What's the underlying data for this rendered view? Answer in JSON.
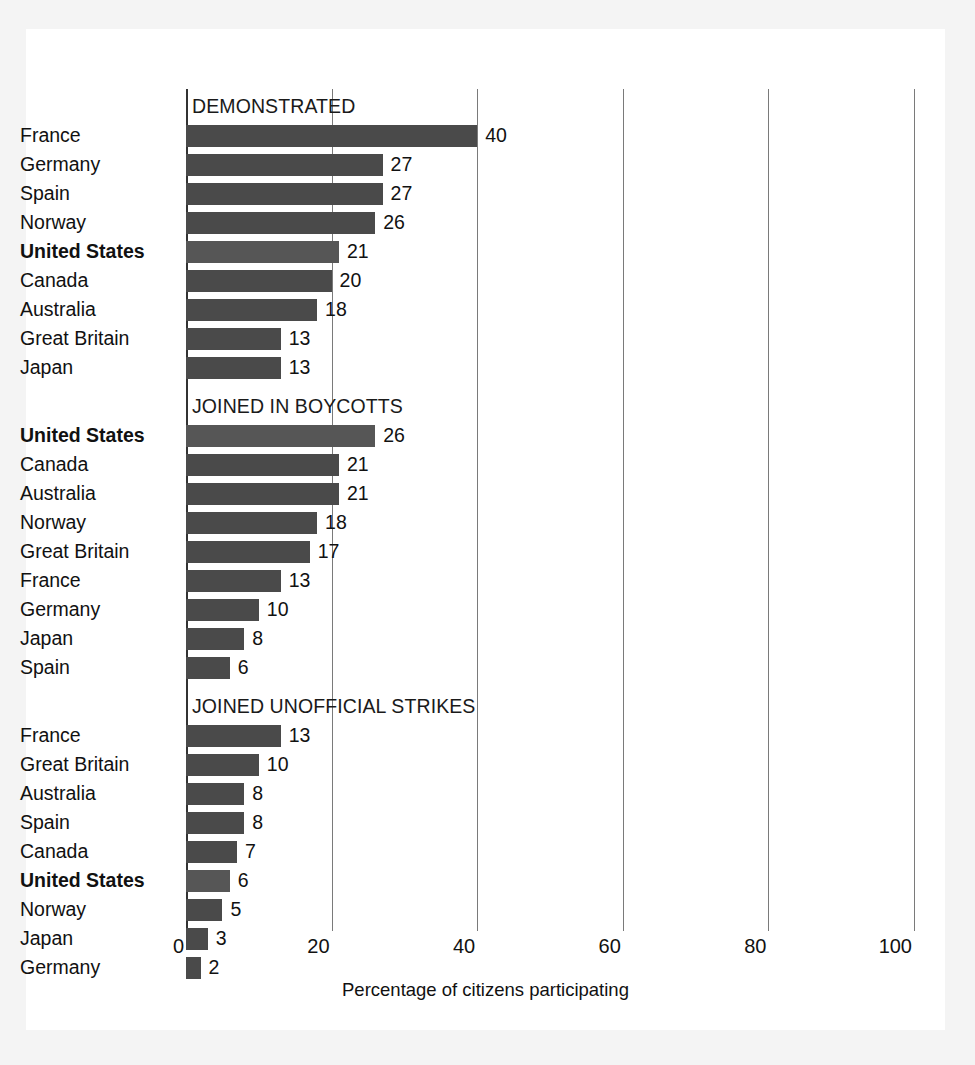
{
  "chart_data": {
    "type": "bar",
    "orientation": "horizontal",
    "title": "",
    "xlabel": "Percentage of citizens participating",
    "ylabel": "",
    "xlim": [
      0,
      100
    ],
    "xticks": [
      0,
      20,
      40,
      60,
      80,
      100
    ],
    "grid": true,
    "legend": "none",
    "highlight_category": "United States",
    "value_suffix": "",
    "panels": [
      {
        "title": "DEMONSTRATED",
        "categories": [
          "France",
          "Germany",
          "Spain",
          "Norway",
          "United States",
          "Canada",
          "Australia",
          "Great Britain",
          "Japan"
        ],
        "values": [
          40,
          27,
          27,
          26,
          21,
          20,
          18,
          13,
          13
        ],
        "bold": [
          false,
          false,
          false,
          false,
          true,
          false,
          false,
          false,
          false
        ]
      },
      {
        "title": "JOINED IN BOYCOTTS",
        "categories": [
          "United States",
          "Canada",
          "Australia",
          "Norway",
          "Great Britain",
          "France",
          "Germany",
          "Japan",
          "Spain"
        ],
        "values": [
          26,
          21,
          21,
          18,
          17,
          13,
          10,
          8,
          6
        ],
        "bold": [
          true,
          false,
          false,
          false,
          false,
          false,
          false,
          false,
          false
        ]
      },
      {
        "title": "JOINED UNOFFICIAL STRIKES",
        "categories": [
          "France",
          "Great Britain",
          "Australia",
          "Spain",
          "Canada",
          "United States",
          "Norway",
          "Japan",
          "Germany"
        ],
        "values": [
          13,
          10,
          8,
          8,
          7,
          6,
          5,
          3,
          2
        ],
        "bold": [
          false,
          false,
          false,
          false,
          false,
          true,
          false,
          false,
          false
        ]
      }
    ]
  },
  "colors": {
    "bar": "#4a4a4a",
    "bar_highlight": "#565656",
    "gridline": "#7a7a7a",
    "axis": "#333333",
    "text": "#111111",
    "card_background": "#ffffff",
    "page_background": "#f4f4f4"
  }
}
